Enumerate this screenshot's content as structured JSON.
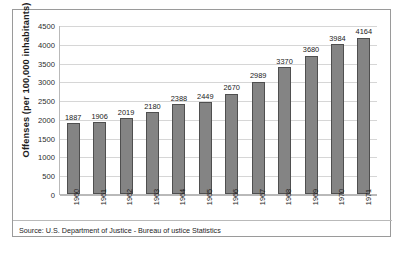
{
  "chart_data": {
    "type": "bar",
    "title": "",
    "subtitle": "",
    "xlabel": "",
    "ylabel": "Offenses (per 100,000 inhabitants)",
    "categories": [
      "1960",
      "1961",
      "1962",
      "1963",
      "1964",
      "1965",
      "1966",
      "1967",
      "1968",
      "1969",
      "1970",
      "1971"
    ],
    "values": [
      1887,
      1906,
      2019,
      2180,
      2388,
      2449,
      2670,
      2989,
      3370,
      3680,
      3984,
      4164
    ],
    "data_labels": [
      "1887",
      "1906",
      "2019",
      "2180",
      "2388",
      "2449",
      "2670",
      "2989",
      "3370",
      "3680",
      "3984",
      "4164"
    ],
    "ylim": [
      0,
      4500
    ],
    "ytick_step": 500,
    "ytick_labels": [
      "4500",
      "4000",
      "3500",
      "3000",
      "2500",
      "2000",
      "1500",
      "1000",
      "500",
      "0"
    ],
    "ytick_values": [
      4500,
      4000,
      3500,
      3000,
      2500,
      2000,
      1500,
      1000,
      500,
      0
    ],
    "grid": true,
    "grid_axis": "y",
    "legend": false,
    "legend_position": "none",
    "series": [
      {
        "name": "Offenses per 100,000 inhabitants",
        "values": [
          1887,
          1906,
          2019,
          2180,
          2388,
          2449,
          2670,
          2989,
          3370,
          3680,
          3984,
          4164
        ]
      }
    ],
    "bar_color": "#848484",
    "bar_outline_color": "#4f4f4f",
    "gridline_color": "#d6d6d6",
    "axis_color": "#b9b9b9",
    "background_color": "#ffffff",
    "xtick_rotation": -90
  },
  "footer": {
    "source_text": "Source: U.S. Department of Justice - Bureau of ustice Statistics"
  }
}
